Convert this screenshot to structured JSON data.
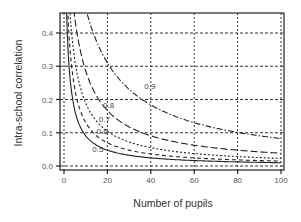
{
  "chart_data": {
    "type": "line",
    "title": "",
    "xlabel": "Number of pupils",
    "ylabel": "Intra-school correlation",
    "xlim": [
      0,
      100
    ],
    "ylim": [
      0,
      0.45
    ],
    "xticks": [
      0,
      20,
      40,
      60,
      80,
      100
    ],
    "xtick_labels": [
      "0",
      "20",
      "40",
      "60",
      "80",
      "100"
    ],
    "yticks": [
      0.0,
      0.1,
      0.2,
      0.3,
      0.4
    ],
    "ytick_labels": [
      "0.0",
      "0.1",
      "0.2",
      "0.3",
      "0.4"
    ],
    "grid": true,
    "grid_style": "dotted",
    "legend": "inline curve labels",
    "x": [
      2,
      3,
      4,
      5,
      6,
      8,
      10,
      12,
      15,
      20,
      25,
      30,
      40,
      50,
      60,
      70,
      80,
      90,
      100
    ],
    "series": [
      {
        "name": "0.9",
        "label": "0.9",
        "line_style": "dash-dot",
        "label_pos": [
          37,
          0.24
        ],
        "values": [
          0.818,
          0.75,
          0.692,
          0.643,
          0.6,
          0.529,
          0.474,
          0.429,
          0.375,
          0.31,
          0.265,
          0.231,
          0.184,
          0.153,
          0.13,
          0.114,
          0.101,
          0.091,
          0.083
        ]
      },
      {
        "name": "0.8",
        "label": "0.8",
        "line_style": "long-dash",
        "label_pos": [
          18,
          0.182
        ],
        "values": [
          0.667,
          0.571,
          0.5,
          0.444,
          0.4,
          0.333,
          0.286,
          0.25,
          0.211,
          0.167,
          0.138,
          0.118,
          0.091,
          0.074,
          0.062,
          0.054,
          0.048,
          0.043,
          0.038
        ]
      },
      {
        "name": "0.7",
        "label": "0.7",
        "line_style": "dotted",
        "label_pos": [
          16,
          0.142
        ],
        "values": [
          0.538,
          0.438,
          0.368,
          0.318,
          0.28,
          0.226,
          0.189,
          0.163,
          0.135,
          0.104,
          0.085,
          0.072,
          0.055,
          0.045,
          0.037,
          0.032,
          0.028,
          0.025,
          0.023
        ]
      },
      {
        "name": "0.6",
        "label": "0.6",
        "line_style": "dashed",
        "label_pos": [
          15,
          0.105
        ],
        "values": [
          0.429,
          0.333,
          0.273,
          0.231,
          0.2,
          0.158,
          0.13,
          0.111,
          0.091,
          0.07,
          0.057,
          0.048,
          0.036,
          0.029,
          0.024,
          0.021,
          0.018,
          0.016,
          0.015
        ]
      },
      {
        "name": "0.5",
        "label": "0.5",
        "line_style": "solid",
        "label_pos": [
          13,
          0.052
        ],
        "values": [
          0.333,
          0.25,
          0.2,
          0.167,
          0.143,
          0.111,
          0.091,
          0.077,
          0.063,
          0.048,
          0.038,
          0.032,
          0.024,
          0.019,
          0.016,
          0.014,
          0.012,
          0.011,
          0.01
        ]
      }
    ]
  }
}
